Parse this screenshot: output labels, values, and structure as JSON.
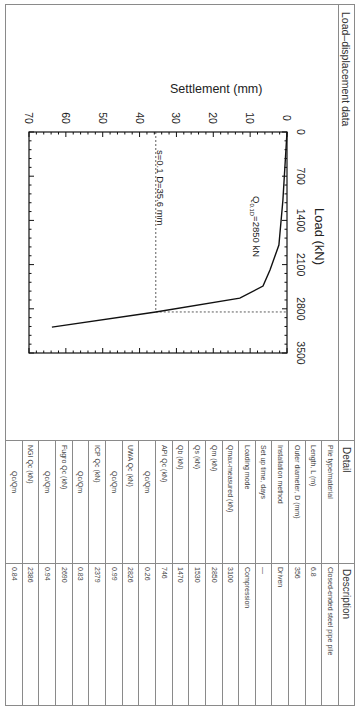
{
  "section": {
    "title": "Load–displacement data"
  },
  "chart_data": {
    "type": "line",
    "title": "",
    "xlabel": "Load (kN)",
    "ylabel": "Settlement (mm)",
    "xlim": [
      0,
      3500
    ],
    "ylim": [
      0,
      70
    ],
    "y_inverted": true,
    "x_ticks": [
      "0",
      "700",
      "1400",
      "2100",
      "2800",
      "3500"
    ],
    "y_ticks": [
      "0",
      "10",
      "20",
      "30",
      "40",
      "50",
      "60",
      "70"
    ],
    "grid": false,
    "series": [
      {
        "name": "Load-settlement curve",
        "x": [
          0,
          1080,
          1790,
          2185,
          2440,
          2630,
          2850,
          3090
        ],
        "y": [
          0,
          1.1,
          2.2,
          4.6,
          6.5,
          12.8,
          35.6,
          63.8
        ]
      }
    ],
    "reference_lines": [
      {
        "type": "horizontal",
        "value": 35.6,
        "label": "s=0.1 D=35.6 mm",
        "style": "dotted"
      },
      {
        "type": "vertical",
        "value": 2850,
        "style": "dotted"
      }
    ],
    "annotations": [
      {
        "text": "Q0.1D=2850 kN",
        "main": "Q",
        "sub": "0.1D",
        "rest": "=2850 kN"
      }
    ],
    "labels": {
      "x_axis": "Load (kN)",
      "y_axis": "Settlement (mm)",
      "ref_line": "s=0.1 D=35.6 mm",
      "q_main": "Q",
      "q_sub": "0.1D",
      "q_rest": "=2850 kN"
    }
  },
  "table": {
    "headers": {
      "detail": "Detail",
      "description": "Description"
    },
    "rows": [
      {
        "detail": "Pile type/material",
        "description": "Closed-ended steel pipe pile"
      },
      {
        "detail": "Length, L (m)",
        "description": "6.8"
      },
      {
        "detail": "Outer diameter, D (mm)",
        "description": "356"
      },
      {
        "detail": "Installation method",
        "description": "Driven"
      },
      {
        "detail": "Set up time, days",
        "description": "—"
      },
      {
        "detail": "Loading mode",
        "description": "Compression"
      },
      {
        "detail": "Qmax-measured (kN)",
        "description": "3100"
      },
      {
        "detail": "Qm (kN)",
        "description": "2850"
      },
      {
        "detail": "Qs (kN)",
        "description": "1530"
      },
      {
        "detail": "Qb (kN)",
        "description": "1470"
      },
      {
        "detail": "API Qc (kN)",
        "description": "746"
      },
      {
        "detail": "Qc/Qm",
        "description": "0.26"
      },
      {
        "detail": "UWA Qc (kN)",
        "description": "2826"
      },
      {
        "detail": "Qc/Qm",
        "description": "0.99"
      },
      {
        "detail": "ICP Qc (kN)",
        "description": "2379"
      },
      {
        "detail": "Qc/Qm",
        "description": "0.83"
      },
      {
        "detail": "Fugro Qc (kN)",
        "description": "2690"
      },
      {
        "detail": "Qc/Qm",
        "description": "0.94"
      },
      {
        "detail": "NGI Qc (kN)",
        "description": "2386"
      },
      {
        "detail": "Qc/Qm",
        "description": "0.84"
      }
    ]
  }
}
